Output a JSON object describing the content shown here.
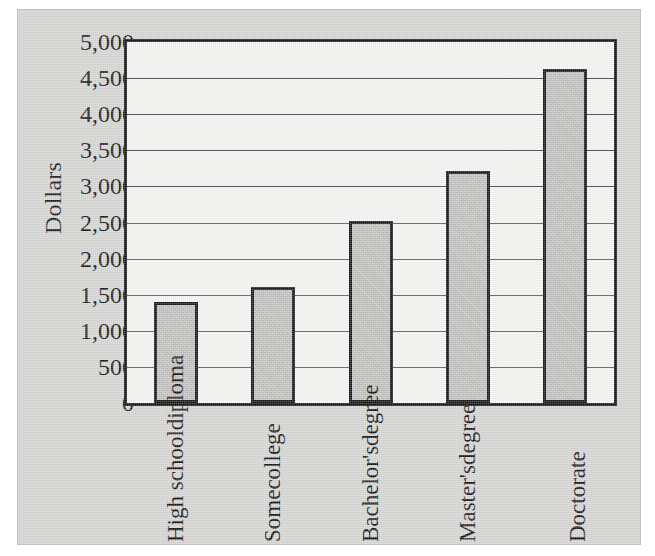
{
  "chart_data": {
    "type": "bar",
    "title": "",
    "xlabel": "",
    "ylabel": "Dollars",
    "ylim": [
      0,
      5000
    ],
    "ytick_step": 500,
    "grid": true,
    "legend": "none",
    "categories": [
      "High school diploma",
      "Some college",
      "Bachelor's degree",
      "Master's degree",
      "Doctorate"
    ],
    "category_lines": [
      [
        "High school",
        "diploma"
      ],
      [
        "Some",
        "college"
      ],
      [
        "Bachelor's",
        "degree"
      ],
      [
        "Master's",
        "degree"
      ],
      [
        "Doctorate"
      ]
    ],
    "values": [
      1400,
      1600,
      2520,
      3220,
      4620
    ],
    "ytick_labels": [
      "0",
      "500",
      "1,000",
      "1,500",
      "2,000",
      "2,500",
      "3,000",
      "3,500",
      "4,000",
      "4,500",
      "5,000"
    ],
    "ytick_values": [
      0,
      500,
      1000,
      1500,
      2000,
      2500,
      3000,
      3500,
      4000,
      4500,
      5000
    ]
  },
  "colors": {
    "page_background": "#ffffff",
    "panel_background": "#d3d3d1",
    "plot_background": "#f2f2f0",
    "bar_fill": "#bcbcba",
    "bar_border": "#141414",
    "gridline": "#4a4a4a",
    "axis_border": "#111111",
    "text": "#111111"
  }
}
